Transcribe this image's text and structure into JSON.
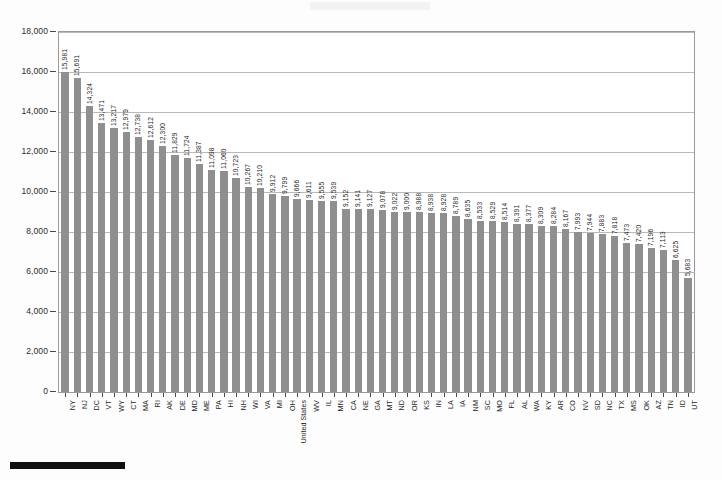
{
  "chart_data": {
    "type": "bar",
    "title": "",
    "subtitle": "",
    "xlabel": "",
    "ylabel": "",
    "ylim": [
      0,
      18000
    ],
    "ytick_step": 2000,
    "ytick_labels": [
      "0",
      "2,000",
      "4,000",
      "6,000",
      "8,000",
      "10,000",
      "12,000",
      "14,000",
      "16,000",
      "18,000"
    ],
    "yticks": [
      0,
      2000,
      4000,
      6000,
      8000,
      10000,
      12000,
      14000,
      16000,
      18000
    ],
    "grid": true,
    "grid_axis": "y",
    "legend": "none",
    "bar_color": "#8f8f8f",
    "value_labels": true,
    "categories": [
      "NY",
      "NJ",
      "DC",
      "VT",
      "WY",
      "CT",
      "MA",
      "RI",
      "AK",
      "DE",
      "MD",
      "ME",
      "PA",
      "HI",
      "NH",
      "WI",
      "VA",
      "MI",
      "OH",
      "United States",
      "WV",
      "IL",
      "MN",
      "CA",
      "NE",
      "GA",
      "MT",
      "ND",
      "OR",
      "KS",
      "IN",
      "LA",
      "IA",
      "NM",
      "SC",
      "MO",
      "FL",
      "AL",
      "WA",
      "KY",
      "AR",
      "CO",
      "NV",
      "SD",
      "NC",
      "TX",
      "MS",
      "OK",
      "AZ",
      "TN",
      "ID",
      "UT"
    ],
    "values": [
      15981,
      15691,
      14324,
      13471,
      13217,
      12979,
      12738,
      12612,
      12300,
      11829,
      11724,
      11387,
      11098,
      11060,
      10723,
      10267,
      10210,
      9912,
      9799,
      9666,
      9611,
      9555,
      9539,
      9152,
      9141,
      9127,
      9078,
      9022,
      9000,
      8988,
      8938,
      8928,
      8789,
      8635,
      8533,
      8529,
      8514,
      8391,
      8377,
      8309,
      8284,
      8167,
      7993,
      7944,
      7883,
      7818,
      7473,
      7420,
      7196,
      7113,
      6625,
      5683
    ],
    "value_labels_text": [
      "15,981",
      "15,691",
      "14,324",
      "13,471",
      "13,217",
      "12,979",
      "12,738",
      "12,612",
      "12,300",
      "11,829",
      "11,724",
      "11,387",
      "11,098",
      "11,060",
      "10,723",
      "10,267",
      "10,210",
      "9,912",
      "9,799",
      "9,666",
      "9,611",
      "9,555",
      "9,539",
      "9,152",
      "9,141",
      "9,127",
      "9,078",
      "9,022",
      "9,000",
      "8,988",
      "8,938",
      "8,928",
      "8,789",
      "8,635",
      "8,533",
      "8,529",
      "8,514",
      "8,391",
      "8,377",
      "8,309",
      "8,284",
      "8,167",
      "7,993",
      "7,944",
      "7,883",
      "7,818",
      "7,473",
      "7,420",
      "7,196",
      "7,113",
      "6,625",
      "5,683"
    ]
  }
}
